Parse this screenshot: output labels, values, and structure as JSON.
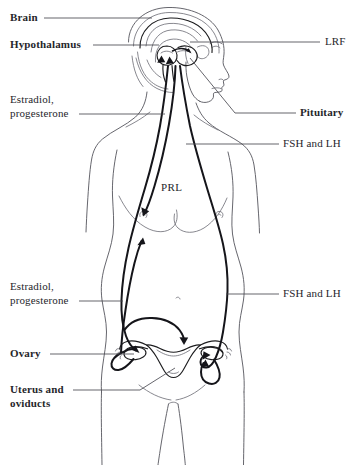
{
  "figure": {
    "background_color": "#ffffff",
    "line_color": "#15151a",
    "outline_color": "#55555c",
    "text_color": "#26262b"
  },
  "labels": {
    "left": [
      {
        "id": "brain",
        "text": "Brain",
        "bold": true,
        "x": 10,
        "y": 12
      },
      {
        "id": "hypothalamus",
        "text": "Hypothalamus",
        "bold": true,
        "x": 10,
        "y": 39
      },
      {
        "id": "estradiol_progesterone_upper_line1",
        "text": "Estradiol,",
        "bold": false,
        "x": 10,
        "y": 94
      },
      {
        "id": "estradiol_progesterone_upper_line2",
        "text": "progesterone",
        "bold": false,
        "x": 10,
        "y": 108
      },
      {
        "id": "estradiol_progesterone_lower_line1",
        "text": "Estradiol,",
        "bold": false,
        "x": 10,
        "y": 281
      },
      {
        "id": "estradiol_progesterone_lower_line2",
        "text": "progesterone",
        "bold": false,
        "x": 10,
        "y": 295
      },
      {
        "id": "ovary",
        "text": "Ovary",
        "bold": true,
        "x": 10,
        "y": 348
      },
      {
        "id": "uterus_oviducts_line1",
        "text": "Uterus and",
        "bold": true,
        "x": 10,
        "y": 384
      },
      {
        "id": "uterus_oviducts_line2",
        "text": "oviducts",
        "bold": true,
        "x": 10,
        "y": 398
      }
    ],
    "right": [
      {
        "id": "lrf",
        "text": "LRF",
        "bold": false,
        "x": 325,
        "y": 36
      },
      {
        "id": "pituitary",
        "text": "Pituitary",
        "bold": true,
        "x": 300,
        "y": 107
      },
      {
        "id": "fsh_lh_upper",
        "text": "FSH and LH",
        "bold": false,
        "x": 283,
        "y": 138
      },
      {
        "id": "fsh_lh_lower",
        "text": "FSH and LH",
        "bold": false,
        "x": 283,
        "y": 288
      }
    ],
    "inline": [
      {
        "id": "prl",
        "text": "PRL",
        "bold": false,
        "x": 161,
        "y": 182
      }
    ]
  },
  "hormones": [
    {
      "name": "LRF",
      "full_name": "Luteinizing hormone-releasing factor",
      "origin": "hypothalamus",
      "target": "pituitary"
    },
    {
      "name": "FSH and LH",
      "full_name": "Follicle stimulating hormone and luteinizing hormone",
      "origin": "pituitary",
      "target": "ovary"
    },
    {
      "name": "PRL",
      "full_name": "Prolactin",
      "origin": "pituitary",
      "target": "breast"
    },
    {
      "name": "Estradiol, progesterone",
      "full_name": "Estradiol and progesterone",
      "origin": "ovary",
      "target": "hypothalamus"
    }
  ],
  "anatomy": [
    {
      "id": "brain",
      "label": "Brain"
    },
    {
      "id": "hypothalamus",
      "label": "Hypothalamus"
    },
    {
      "id": "pituitary",
      "label": "Pituitary"
    },
    {
      "id": "breast",
      "label": "Breast"
    },
    {
      "id": "ovary",
      "label": "Ovary"
    },
    {
      "id": "uterus",
      "label": "Uterus and oviducts"
    }
  ]
}
